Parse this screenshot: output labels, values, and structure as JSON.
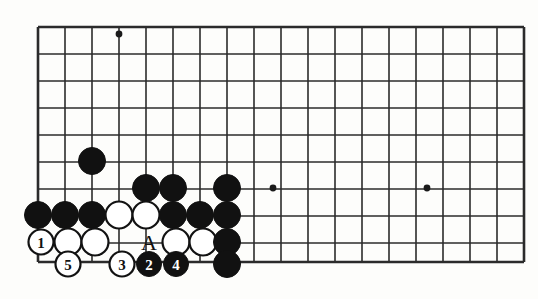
{
  "diagram": {
    "kind": "go-board-diagram",
    "title": "",
    "geometry": {
      "origin_x": 38,
      "origin_y": 27,
      "spacing": 27,
      "cols": 18,
      "rows": 9,
      "bottom_edge_y": 262,
      "board_right_x": 505
    },
    "colors": {
      "line": "#2b2b2b",
      "black_stone": "#111111",
      "white_stone": "#ffffff",
      "background": "#fdfdfb"
    },
    "hoshi_points": [
      {
        "col": 3,
        "row": 0,
        "x": 119,
        "y": 34
      },
      {
        "col": 9,
        "row": 6,
        "x": 273,
        "y": 188
      },
      {
        "col": 15,
        "row": 6,
        "x": 427,
        "y": 188
      }
    ],
    "stones": [
      {
        "id": "b1",
        "color": "black",
        "x": 92,
        "y": 161,
        "label": ""
      },
      {
        "id": "b2",
        "color": "black",
        "x": 146,
        "y": 188,
        "label": ""
      },
      {
        "id": "b3",
        "color": "black",
        "x": 173,
        "y": 188,
        "label": ""
      },
      {
        "id": "b4",
        "color": "black",
        "x": 227,
        "y": 188,
        "label": ""
      },
      {
        "id": "b5",
        "color": "black",
        "x": 38,
        "y": 215,
        "label": ""
      },
      {
        "id": "b6",
        "color": "black",
        "x": 65,
        "y": 215,
        "label": ""
      },
      {
        "id": "b7",
        "color": "black",
        "x": 92,
        "y": 215,
        "label": ""
      },
      {
        "id": "w1",
        "color": "white",
        "x": 119,
        "y": 215,
        "label": ""
      },
      {
        "id": "w2",
        "color": "white",
        "x": 146,
        "y": 215,
        "label": ""
      },
      {
        "id": "b8",
        "color": "black",
        "x": 173,
        "y": 215,
        "label": ""
      },
      {
        "id": "b9",
        "color": "black",
        "x": 200,
        "y": 215,
        "label": ""
      },
      {
        "id": "b10",
        "color": "black",
        "x": 227,
        "y": 215,
        "label": ""
      },
      {
        "id": "m1",
        "color": "white",
        "x": 41,
        "y": 242,
        "label": "1"
      },
      {
        "id": "w3",
        "color": "white",
        "x": 68,
        "y": 242,
        "label": ""
      },
      {
        "id": "w4",
        "color": "white",
        "x": 95,
        "y": 242,
        "label": ""
      },
      {
        "id": "w5",
        "color": "white",
        "x": 176,
        "y": 242,
        "label": ""
      },
      {
        "id": "w6",
        "color": "white",
        "x": 203,
        "y": 242,
        "label": ""
      },
      {
        "id": "b11",
        "color": "black",
        "x": 227,
        "y": 242,
        "label": ""
      },
      {
        "id": "m5",
        "color": "white",
        "x": 68,
        "y": 264,
        "label": "5"
      },
      {
        "id": "m3",
        "color": "white",
        "x": 122,
        "y": 264,
        "label": "3"
      },
      {
        "id": "m2",
        "color": "black",
        "x": 149,
        "y": 264,
        "label": "2"
      },
      {
        "id": "m4",
        "color": "black",
        "x": 176,
        "y": 264,
        "label": "4"
      },
      {
        "id": "b12",
        "color": "black",
        "x": 227,
        "y": 264,
        "label": ""
      }
    ],
    "point_labels": [
      {
        "id": "pt-a",
        "text": "A",
        "x": 149,
        "y": 242
      }
    ],
    "move_numbers": [
      "1",
      "2",
      "3",
      "4",
      "5"
    ],
    "stone_radius": 13.5,
    "numbered_stone_radius": 12.5
  }
}
